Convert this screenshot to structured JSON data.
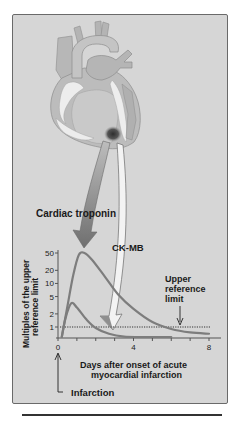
{
  "figure": {
    "labels": {
      "troponin_arrow": "Cardiac troponin",
      "ckmb_arrow": "CK-MB",
      "upper_ref_line1": "Upper",
      "upper_ref_line2": "reference",
      "upper_ref_line3": "limit",
      "x_axis_line1": "Days after onset of acute",
      "x_axis_line2": "myocardial infarction",
      "y_axis_line1": "Multiples of the upper",
      "y_axis_line2": "reference limit",
      "infarction": "Infarction"
    },
    "colors": {
      "panel": "#d6d6d6",
      "heart_fill": "#b9b9b9",
      "heart_light": "#ececec",
      "infarct": "#444444",
      "curve": "#7a7a7a",
      "troponin_arrow": "#8a8a8a",
      "ckmb_arrow": "#f2f2f2"
    }
  },
  "chart_data": {
    "type": "line",
    "title": "",
    "xlabel": "Days after onset of acute myocardial infarction",
    "ylabel": "Multiples of the upper reference limit",
    "xlim": [
      0,
      8.5
    ],
    "ylim_log": [
      0.5,
      60
    ],
    "y_scale": "log",
    "x_ticks": [
      0,
      4,
      8
    ],
    "x_minor_ticks": [
      1,
      2,
      3,
      5,
      6,
      7
    ],
    "y_ticks": [
      1,
      2,
      5,
      10,
      20,
      50
    ],
    "y_tick_labels": [
      "1",
      "2",
      "5",
      "10",
      "20",
      "50"
    ],
    "x_tick_labels": [
      "0",
      "4",
      "8"
    ],
    "reference_line": {
      "y": 1,
      "label": "Upper reference limit",
      "style": "dotted"
    },
    "series": [
      {
        "name": "Cardiac troponin",
        "x": [
          0.2,
          0.5,
          0.8,
          1.1,
          1.4,
          1.8,
          2.5,
          3.2,
          4.0,
          5.0,
          6.0,
          7.0,
          8.0
        ],
        "y": [
          0.5,
          3,
          15,
          45,
          50,
          35,
          14,
          5.5,
          2.6,
          1.3,
          0.9,
          0.75,
          0.7
        ]
      },
      {
        "name": "CK-MB",
        "x": [
          0.2,
          0.4,
          0.7,
          1.0,
          1.5,
          2.0,
          2.7,
          3.5,
          4.5,
          6.0
        ],
        "y": [
          0.5,
          1.6,
          3.5,
          2.8,
          1.5,
          0.95,
          0.7,
          0.6,
          0.55,
          0.55
        ]
      }
    ],
    "annotations": [
      "Infarction at day 0",
      "Upper reference limit"
    ]
  }
}
